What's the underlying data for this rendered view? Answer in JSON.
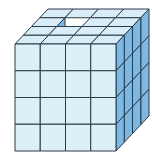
{
  "diagram": {
    "type": "isometric-cube-stack",
    "grid": {
      "cols": 4,
      "rows": 4,
      "depth": 4
    },
    "missing_cubes": [
      {
        "col": 1,
        "row": 0,
        "depth": 2
      }
    ],
    "geometry": {
      "front_origin": [
        15,
        44
      ],
      "cell_w": 25.25,
      "cell_h": 26.75,
      "depth_dx": 8.25,
      "depth_dy": -8.75
    },
    "colors": {
      "front": "#dcf0f8",
      "top": "#d8edf8",
      "side": "#7db7e2",
      "hole_side": "#7db7e2",
      "hole_floor": "#d3eaf6",
      "stroke": "#2b3a45",
      "background": "#ffffff"
    }
  }
}
